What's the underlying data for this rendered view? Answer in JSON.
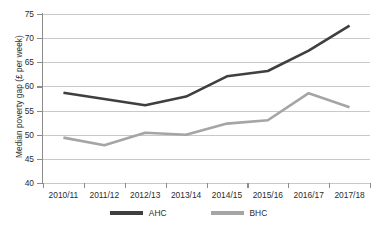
{
  "chart_data": {
    "type": "line",
    "title": "",
    "xlabel": "",
    "ylabel": "Median poverty gap (£ per week)",
    "categories": [
      "2010/11",
      "2011/12",
      "2012/13",
      "2013/14",
      "2014/15",
      "2015/16",
      "2016/17",
      "2017/18"
    ],
    "series": [
      {
        "name": "AHC",
        "color": "#3f3f3f",
        "values": [
          58.7,
          57.4,
          56.1,
          57.9,
          62.1,
          63.2,
          67.4,
          72.6
        ]
      },
      {
        "name": "BHC",
        "color": "#a5a5a5",
        "values": [
          49.4,
          47.8,
          50.4,
          50.0,
          52.3,
          53.0,
          58.6,
          55.7
        ]
      }
    ],
    "ylim": [
      40,
      75
    ],
    "ytick_values": [
      40,
      45,
      50,
      55,
      60,
      65,
      70,
      75
    ],
    "ytick_labels": [
      "40",
      "45",
      "50",
      "55",
      "60",
      "65",
      "70",
      "75"
    ],
    "grid": "horizontal",
    "legend_position": "bottom",
    "gridline_color": "#c9c9c9",
    "axis_color": "#8c8c8c",
    "background_color": "#ffffff"
  },
  "legend": {
    "entries": [
      {
        "label": "AHC"
      },
      {
        "label": "BHC"
      }
    ]
  }
}
